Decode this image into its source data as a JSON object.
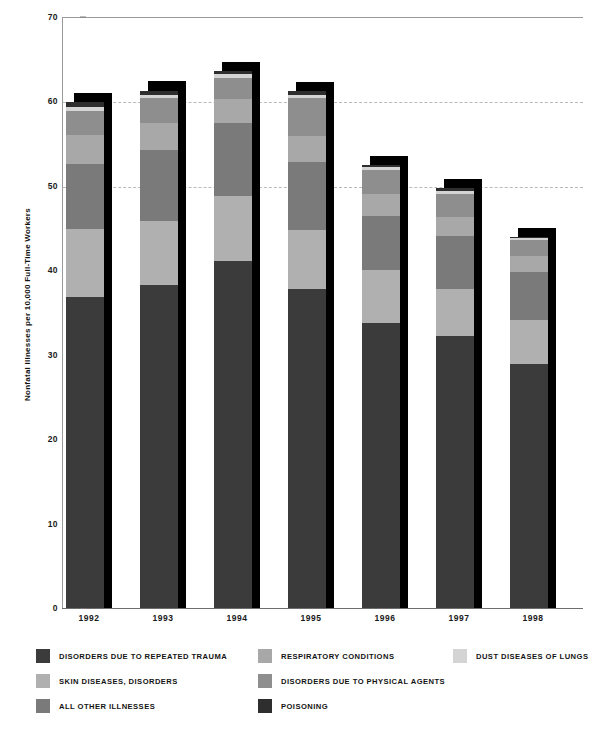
{
  "chart_data": {
    "type": "bar",
    "subtype": "stacked-bar",
    "title": "",
    "xlabel": "",
    "ylabel": "Nonfatal Illnesses per 10,000 Full-Time Workers",
    "categories": [
      "1992",
      "1993",
      "1994",
      "1995",
      "1996",
      "1997",
      "1998"
    ],
    "ylim": [
      0,
      70
    ],
    "ytick_values": [
      0,
      10,
      20,
      30,
      40,
      50,
      60,
      70
    ],
    "ytick_labels": [
      "0",
      "10",
      "20",
      "30",
      "40",
      "50",
      "60",
      "70"
    ],
    "grid": true,
    "gridlines_at": [
      50,
      60,
      70
    ],
    "legend_position": "below",
    "series": [
      {
        "name": "DISORDERS DUE TO REPEATED TRAUMA",
        "color": "#3b3b3b",
        "values": [
          36.8,
          38.3,
          41.1,
          37.8,
          33.7,
          32.2,
          28.9
        ]
      },
      {
        "name": "SKIN DISEASES, DISORDERS",
        "color": "#b0b0b0",
        "values": [
          8.1,
          7.5,
          7.7,
          7.0,
          6.3,
          5.6,
          5.2
        ]
      },
      {
        "name": "ALL OTHER ILLNESSES",
        "color": "#7a7a7a",
        "values": [
          7.7,
          8.4,
          8.7,
          8.0,
          6.4,
          6.3,
          5.7
        ]
      },
      {
        "name": "RESPIRATORY CONDITIONS",
        "color": "#a8a8a8",
        "values": [
          3.4,
          3.3,
          2.8,
          3.1,
          2.6,
          2.2,
          1.9
        ]
      },
      {
        "name": "DISORDERS DUE TO PHYSICAL AGENTS",
        "color": "#8e8e8e",
        "values": [
          2.9,
          2.9,
          2.5,
          4.5,
          2.9,
          2.8,
          1.9
        ]
      },
      {
        "name": "DUST DISEASES OF LUNGS",
        "color": "#d4d4d4",
        "values": [
          0.5,
          0.4,
          0.4,
          0.4,
          0.3,
          0.3,
          0.2
        ]
      },
      {
        "name": "POISONING",
        "color": "#2e2e2e",
        "values": [
          0.5,
          0.5,
          0.4,
          0.4,
          0.3,
          0.3,
          0.2
        ]
      }
    ],
    "totals": [
      59.9,
      61.3,
      63.6,
      61.2,
      52.5,
      49.7,
      44.0
    ]
  },
  "legend": {
    "rows": [
      [
        {
          "label": "DISORDERS DUE TO REPEATED TRAUMA",
          "color": "#3b3b3b",
          "col": "col-1"
        },
        {
          "label": "RESPIRATORY CONDITIONS",
          "color": "#a8a8a8",
          "col": "col-2"
        },
        {
          "label": "DUST DISEASES OF LUNGS",
          "color": "#d4d4d4",
          "col": "col-3"
        }
      ],
      [
        {
          "label": "SKIN DISEASES, DISORDERS",
          "color": "#b0b0b0",
          "col": "col-1"
        },
        {
          "label": "DISORDERS DUE TO PHYSICAL AGENTS",
          "color": "#8e8e8e",
          "col": "col-2"
        }
      ],
      [
        {
          "label": "ALL OTHER ILLNESSES",
          "color": "#7a7a7a",
          "col": "col-1"
        },
        {
          "label": "POISONING",
          "color": "#2e2e2e",
          "col": "col-2"
        }
      ]
    ]
  },
  "axis": {
    "shadow_color": "#000000"
  }
}
